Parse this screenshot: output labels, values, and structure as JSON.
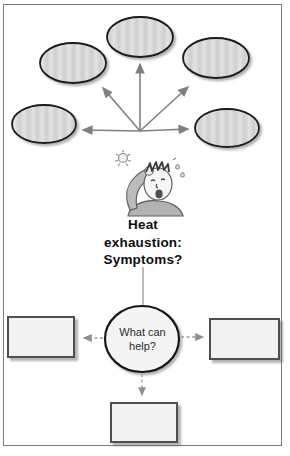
{
  "page": {
    "heading": {
      "line1": "Heat",
      "line2": "exhaustion:",
      "line3": "Symptoms?"
    },
    "center_node": {
      "label": "What can help?"
    },
    "symptom_nodes": [
      {
        "position": "top",
        "label": ""
      },
      {
        "position": "upper-left",
        "label": ""
      },
      {
        "position": "upper-right",
        "label": ""
      },
      {
        "position": "mid-left",
        "label": ""
      },
      {
        "position": "mid-right",
        "label": ""
      }
    ],
    "help_boxes": [
      {
        "position": "left",
        "label": ""
      },
      {
        "position": "right",
        "label": ""
      },
      {
        "position": "bottom",
        "label": ""
      }
    ],
    "illustration": {
      "alt": "cartoon person wiping sweaty brow beneath a small sun"
    },
    "colors": {
      "node_fill": "#d9d9d9",
      "node_stroke": "#1a1a1a",
      "solid_arrow": "#7f7f7f",
      "dashed_arrow": "#9a9a9a",
      "box_fill": "#f2f2f2",
      "box_border": "#4f4f4f",
      "circle_fill": "#f4f4f4",
      "frame_border": "#7b7b7b",
      "heading_text": "#0d0d0d"
    }
  }
}
